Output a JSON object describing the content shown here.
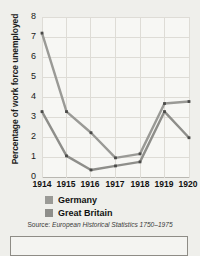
{
  "chart_data": {
    "type": "line",
    "title": "",
    "xlabel": "",
    "ylabel": "Percentage of work force unemployed",
    "categories": [
      "1914",
      "1915",
      "1916",
      "1917",
      "1918",
      "1919",
      "1920"
    ],
    "x": [
      1914,
      1915,
      1916,
      1917,
      1918,
      1919,
      1920
    ],
    "ylim": [
      0,
      8
    ],
    "yticks": [
      0,
      1,
      2,
      3,
      4,
      5,
      6,
      7,
      8
    ],
    "ytick_labels": [
      "0",
      "1",
      "2",
      "3",
      "4",
      "5",
      "6",
      "7",
      "8"
    ],
    "grid": true,
    "legend_position": "below-axes-left",
    "series": [
      {
        "name": "Germany",
        "color": "#9a9a96",
        "values": [
          7.2,
          3.3,
          2.25,
          1.0,
          1.2,
          3.7,
          3.8
        ]
      },
      {
        "name": "Great Britain",
        "color": "#8e8e8a",
        "values": [
          3.3,
          1.1,
          0.4,
          0.6,
          0.8,
          3.3,
          2.0
        ]
      }
    ],
    "source": "European Historical Statistics 1750-1975"
  },
  "axes": {
    "ylabel": "Percentage of work force unemployed",
    "yticks": [
      "8",
      "7",
      "6",
      "5",
      "4",
      "3",
      "2",
      "1",
      "0"
    ],
    "xticks": [
      "1914",
      "1915",
      "1916",
      "1917",
      "1918",
      "1919",
      "1920"
    ]
  },
  "legend": {
    "items": [
      {
        "label": "Germany",
        "color": "#9a9a96"
      },
      {
        "label": "Great Britain",
        "color": "#8e8e8a"
      }
    ]
  },
  "source": {
    "prefix": "Source:",
    "text": "European Historical Statistics 1750–1975"
  },
  "colors": {
    "background": "#efefeb",
    "plot_background": "#f7f7f4",
    "grid": "#dedcd6",
    "axis": "#b9b7b1",
    "text": "#1a1a1a",
    "series_germany": "#9a9a96",
    "series_great_britain": "#8e8e8a"
  }
}
